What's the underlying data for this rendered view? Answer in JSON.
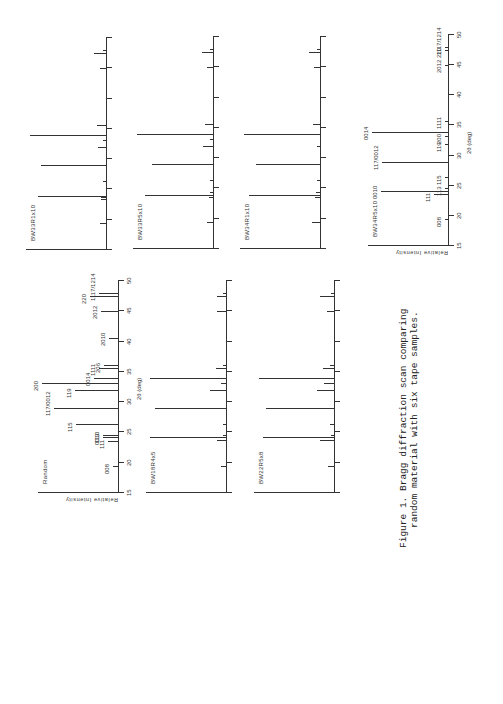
{
  "figure": {
    "caption_line1": "Figure 1. Bragg diffraction scan comparing",
    "caption_line2": "random material with six tape samples.",
    "xlabel": "2θ (deg)",
    "ylabel": "Relative Intensity"
  },
  "chart_data": {
    "type": "bar",
    "title": "Bragg diffraction scan comparing random material with six tape samples",
    "xlabel": "2θ (deg)",
    "ylabel": "Relative Intensity",
    "xlim": [
      15,
      50
    ],
    "xticks": [
      15,
      20,
      25,
      30,
      35,
      40,
      45,
      50
    ],
    "panels": [
      {
        "name": "Random",
        "peaks": [
          {
            "x": 19.3,
            "h": 0.07,
            "label": "008"
          },
          {
            "x": 23.5,
            "h": 0.13,
            "label": "111"
          },
          {
            "x": 24.0,
            "h": 0.2,
            "label": "0010"
          },
          {
            "x": 24.4,
            "h": 0.2,
            "label": "113"
          },
          {
            "x": 26.2,
            "h": 0.55,
            "label": "115"
          },
          {
            "x": 28.8,
            "h": 0.84,
            "label": "117/0012"
          },
          {
            "x": 31.8,
            "h": 0.56,
            "label": "119"
          },
          {
            "x": 33.0,
            "h": 1.0,
            "label": "200"
          },
          {
            "x": 33.8,
            "h": 0.32,
            "label": "0014"
          },
          {
            "x": 35.5,
            "h": 0.25,
            "label": "1111"
          },
          {
            "x": 36.0,
            "h": 0.18,
            "label": "206"
          },
          {
            "x": 40.5,
            "h": 0.12,
            "label": "2010"
          },
          {
            "x": 44.8,
            "h": 0.23,
            "label": "2012"
          },
          {
            "x": 47.3,
            "h": 0.37,
            "label": "220"
          },
          {
            "x": 47.9,
            "h": 0.25,
            "label": "1117/1214"
          }
        ]
      },
      {
        "name": "BW18R4x5",
        "peaks": [
          {
            "x": 19.3,
            "h": 0.07
          },
          {
            "x": 23.6,
            "h": 0.12
          },
          {
            "x": 24.0,
            "h": 1.0
          },
          {
            "x": 24.4,
            "h": 0.04
          },
          {
            "x": 26.2,
            "h": 0.04
          },
          {
            "x": 28.8,
            "h": 0.93
          },
          {
            "x": 31.8,
            "h": 0.21
          },
          {
            "x": 33.0,
            "h": 0.07
          },
          {
            "x": 33.8,
            "h": 1.0
          },
          {
            "x": 35.5,
            "h": 0.13
          },
          {
            "x": 36.0,
            "h": 0.04
          },
          {
            "x": 44.8,
            "h": 0.12
          },
          {
            "x": 47.3,
            "h": 0.12
          },
          {
            "x": 47.9,
            "h": 0.04
          }
        ]
      },
      {
        "name": "BW22R5x8",
        "peaks": [
          {
            "x": 19.3,
            "h": 0.08
          },
          {
            "x": 23.6,
            "h": 0.18
          },
          {
            "x": 24.0,
            "h": 0.93
          },
          {
            "x": 24.4,
            "h": 0.04
          },
          {
            "x": 26.2,
            "h": 0.05
          },
          {
            "x": 28.8,
            "h": 0.89
          },
          {
            "x": 31.8,
            "h": 0.23
          },
          {
            "x": 33.0,
            "h": 0.13
          },
          {
            "x": 33.8,
            "h": 0.99
          },
          {
            "x": 35.5,
            "h": 0.14
          },
          {
            "x": 36.0,
            "h": 0.05
          },
          {
            "x": 44.8,
            "h": 0.09
          },
          {
            "x": 47.3,
            "h": 0.18
          },
          {
            "x": 47.9,
            "h": 0.04
          }
        ]
      },
      {
        "name": "BW33R1x10",
        "peaks": [
          {
            "x": 19.3,
            "h": 0.08
          },
          {
            "x": 23.3,
            "h": 0.07
          },
          {
            "x": 23.6,
            "h": 0.07
          },
          {
            "x": 23.8,
            "h": 0.9
          },
          {
            "x": 26.2,
            "h": 0.03
          },
          {
            "x": 28.8,
            "h": 0.85
          },
          {
            "x": 31.8,
            "h": 0.1
          },
          {
            "x": 33.0,
            "h": 0.02
          },
          {
            "x": 33.8,
            "h": 1.0
          },
          {
            "x": 35.5,
            "h": 0.12
          },
          {
            "x": 44.8,
            "h": 0.08
          },
          {
            "x": 47.3,
            "h": 0.16
          },
          {
            "x": 47.9,
            "h": 0.04
          }
        ]
      },
      {
        "name": "BW33R5x10",
        "peaks": [
          {
            "x": 19.3,
            "h": 0.08
          },
          {
            "x": 23.5,
            "h": 0.05
          },
          {
            "x": 23.8,
            "h": 0.9
          },
          {
            "x": 24.2,
            "h": 0.04
          },
          {
            "x": 26.2,
            "h": 0.03
          },
          {
            "x": 28.8,
            "h": 0.8
          },
          {
            "x": 31.8,
            "h": 0.13
          },
          {
            "x": 33.0,
            "h": 0.02
          },
          {
            "x": 33.8,
            "h": 1.0
          },
          {
            "x": 35.5,
            "h": 0.1
          },
          {
            "x": 44.8,
            "h": 0.08
          },
          {
            "x": 47.3,
            "h": 0.15
          },
          {
            "x": 47.9,
            "h": 0.04
          }
        ]
      },
      {
        "name": "BW34R1x10",
        "peaks": [
          {
            "x": 19.3,
            "h": 0.1
          },
          {
            "x": 23.5,
            "h": 0.07
          },
          {
            "x": 23.8,
            "h": 0.93
          },
          {
            "x": 24.2,
            "h": 0.05
          },
          {
            "x": 26.2,
            "h": 0.03
          },
          {
            "x": 28.8,
            "h": 0.84
          },
          {
            "x": 31.8,
            "h": 0.03
          },
          {
            "x": 33.8,
            "h": 1.0
          },
          {
            "x": 35.5,
            "h": 0.09
          },
          {
            "x": 44.8,
            "h": 0.08
          },
          {
            "x": 47.3,
            "h": 0.14
          },
          {
            "x": 47.9,
            "h": 0.03
          }
        ]
      },
      {
        "name": "BW34R5x10",
        "peaks": [
          {
            "x": 19.3,
            "h": 0.02,
            "label": "008"
          },
          {
            "x": 23.5,
            "h": 0.18,
            "label": "111"
          },
          {
            "x": 24.0,
            "h": 0.88,
            "label": "0010"
          },
          {
            "x": 24.4,
            "h": 0.03,
            "label": "113"
          },
          {
            "x": 26.2,
            "h": 0.03,
            "label": "115"
          },
          {
            "x": 28.8,
            "h": 0.87,
            "label": "117/0012"
          },
          {
            "x": 31.8,
            "h": 0.03,
            "label": "119"
          },
          {
            "x": 33.0,
            "h": 0.04,
            "label": "200"
          },
          {
            "x": 33.8,
            "h": 1.0,
            "label": "0014"
          },
          {
            "x": 35.5,
            "h": 0.03,
            "label": "1111"
          },
          {
            "x": 44.8,
            "h": 0.03,
            "label": "2012"
          },
          {
            "x": 47.3,
            "h": 0.04,
            "label": "220"
          },
          {
            "x": 47.9,
            "h": 0.03,
            "label": "1117/1214"
          }
        ]
      }
    ]
  }
}
